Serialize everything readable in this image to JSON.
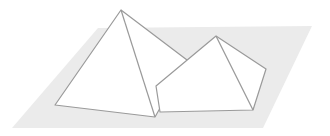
{
  "diagram": {
    "type": "geometric-illustration",
    "colors": {
      "background": "#ffffff",
      "ground": "#ebebeb",
      "face": "#ffffff",
      "stroke": "#9a9a9a"
    },
    "ground_plane": {
      "points": "98,28 312,26 263,128 12,128"
    },
    "large_pyramid": {
      "outline": "121,10 187,60 155,117 55,105",
      "edges": [
        {
          "x1": 121,
          "y1": 10,
          "x2": 155,
          "y2": 117
        }
      ]
    },
    "small_pyramid": {
      "outline": "216,36 266,69 253,110 160,112 156,86",
      "edges": [
        {
          "x1": 216,
          "y1": 36,
          "x2": 253,
          "y2": 110
        }
      ]
    }
  }
}
